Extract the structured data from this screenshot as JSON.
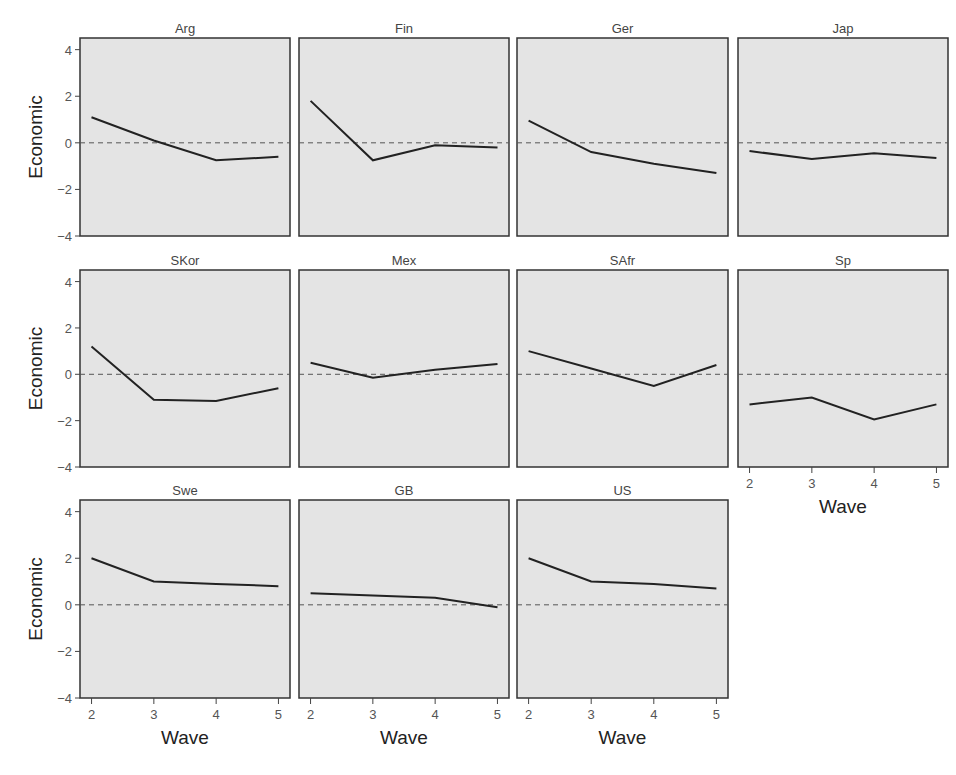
{
  "chart_data": {
    "type": "line",
    "layout": "small-multiples",
    "xlabel": "Wave",
    "ylabel": "Economic",
    "x": [
      2,
      3,
      4,
      5
    ],
    "xticks": [
      "2",
      "3",
      "4",
      "5"
    ],
    "ylim": [
      -4,
      4.5
    ],
    "yticks": [
      "4",
      "2",
      "0",
      "-2",
      "-4"
    ],
    "reference_line": {
      "y": 0,
      "style": "dashed"
    },
    "grid": false,
    "panel_background": "#e4e4e4",
    "line_color": "#222222",
    "series": [
      {
        "name": "Arg",
        "values": [
          1.1,
          0.1,
          -0.75,
          -0.6
        ]
      },
      {
        "name": "Fin",
        "values": [
          1.8,
          -0.75,
          -0.1,
          -0.2
        ]
      },
      {
        "name": "Ger",
        "values": [
          0.95,
          -0.4,
          -0.9,
          -1.3
        ]
      },
      {
        "name": "Jap",
        "values": [
          -0.35,
          -0.7,
          -0.45,
          -0.65
        ]
      },
      {
        "name": "SKor",
        "values": [
          1.2,
          -1.1,
          -1.15,
          -0.6
        ]
      },
      {
        "name": "Mex",
        "values": [
          0.5,
          -0.15,
          0.2,
          0.45
        ]
      },
      {
        "name": "SAfr",
        "values": [
          1.0,
          0.25,
          -0.5,
          0.4
        ]
      },
      {
        "name": "Sp",
        "values": [
          -1.3,
          -1.0,
          -1.95,
          -1.3
        ]
      },
      {
        "name": "Swe",
        "values": [
          2.0,
          1.0,
          0.9,
          0.8
        ]
      },
      {
        "name": "GB",
        "values": [
          0.5,
          0.4,
          0.3,
          -0.1
        ]
      },
      {
        "name": "US",
        "values": [
          2.0,
          1.0,
          0.9,
          0.7
        ]
      }
    ]
  }
}
